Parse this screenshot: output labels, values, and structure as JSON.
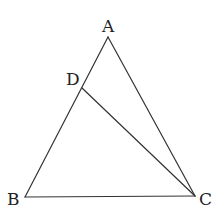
{
  "diagram": {
    "type": "triangle",
    "points": {
      "A": {
        "label": "A",
        "x": 108,
        "y": 37
      },
      "B": {
        "label": "B",
        "x": 25,
        "y": 197
      },
      "C": {
        "label": "C",
        "x": 195,
        "y": 196
      },
      "D": {
        "label": "D",
        "x": 82,
        "y": 88
      }
    },
    "segments": [
      {
        "from": "A",
        "to": "B"
      },
      {
        "from": "A",
        "to": "C"
      },
      {
        "from": "B",
        "to": "C"
      },
      {
        "from": "D",
        "to": "C"
      }
    ],
    "colors": {
      "line": "#333333",
      "text": "#222222",
      "background": "#ffffff"
    }
  }
}
